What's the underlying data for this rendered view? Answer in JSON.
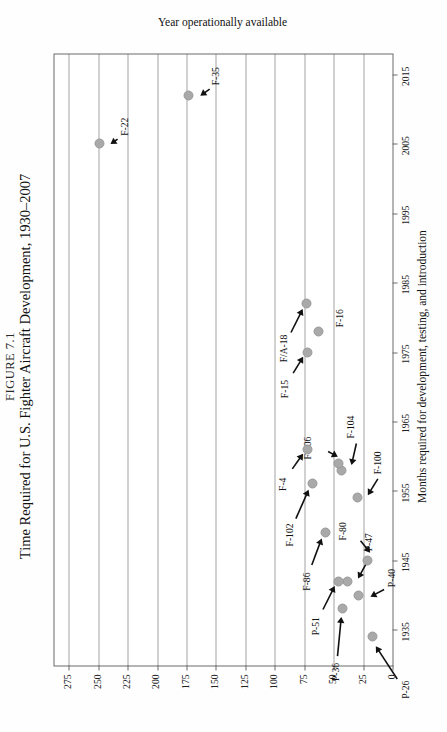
{
  "figure": {
    "number": "FIGURE 7.1",
    "title": "Time Required for U.S. Fighter Aircraft Development, 1930–2007"
  },
  "chart_data": {
    "type": "scatter",
    "title": "Time Required for U.S. Fighter Aircraft Development, 1930–2007",
    "xlabel": "Year operationally available",
    "ylabel": "Months required for development, testing, and introduction",
    "xlim": [
      1930,
      2018
    ],
    "ylim": [
      0,
      287
    ],
    "xticks": [
      1935,
      1945,
      1955,
      1965,
      1975,
      1985,
      1995,
      2005,
      2015
    ],
    "xticklabels": [
      "1935",
      "1945",
      "1955",
      "1965",
      "1975",
      "1985",
      "1995",
      "2005",
      "2015"
    ],
    "yticks": [
      0,
      25,
      50,
      75,
      100,
      125,
      150,
      175,
      200,
      225,
      250,
      275
    ],
    "yticklabels": [
      "0",
      "25",
      "50",
      "75",
      "100",
      "125",
      "150",
      "175",
      "200",
      "225",
      "250",
      "275"
    ],
    "grid": "y-gridlines-dotted",
    "legend": "none",
    "marker": {
      "shape": "circle",
      "color": "#a9a9a9",
      "size": 8
    },
    "points": [
      {
        "label": "P-26",
        "x": 1934,
        "y": 18
      },
      {
        "label": "P-36",
        "x": 1938,
        "y": 43
      },
      {
        "label": "P-40",
        "x": 1940,
        "y": 30
      },
      {
        "label": "P-47",
        "x": 1942,
        "y": 39
      },
      {
        "label": "P-51",
        "x": 1942,
        "y": 47
      },
      {
        "label": "F-80",
        "x": 1945,
        "y": 22
      },
      {
        "label": "F-86",
        "x": 1949,
        "y": 58
      },
      {
        "label": "F-100",
        "x": 1954,
        "y": 31
      },
      {
        "label": "F-102",
        "x": 1956,
        "y": 69
      },
      {
        "label": "F-104",
        "x": 1958,
        "y": 44
      },
      {
        "label": "F-106",
        "x": 1959,
        "y": 47
      },
      {
        "label": "F-4",
        "x": 1961,
        "y": 73
      },
      {
        "label": "F-15",
        "x": 1975,
        "y": 73
      },
      {
        "label": "F-16",
        "x": 1978,
        "y": 64
      },
      {
        "label": "F/A-18",
        "x": 1982,
        "y": 74
      },
      {
        "label": "F-22",
        "x": 2005,
        "y": 250
      },
      {
        "label": "F-35",
        "x": 2012,
        "y": 174
      }
    ]
  },
  "axes": {
    "x_axis_label": "Year operationally available",
    "y_axis_label": "Months required for development, testing, and introduction"
  }
}
